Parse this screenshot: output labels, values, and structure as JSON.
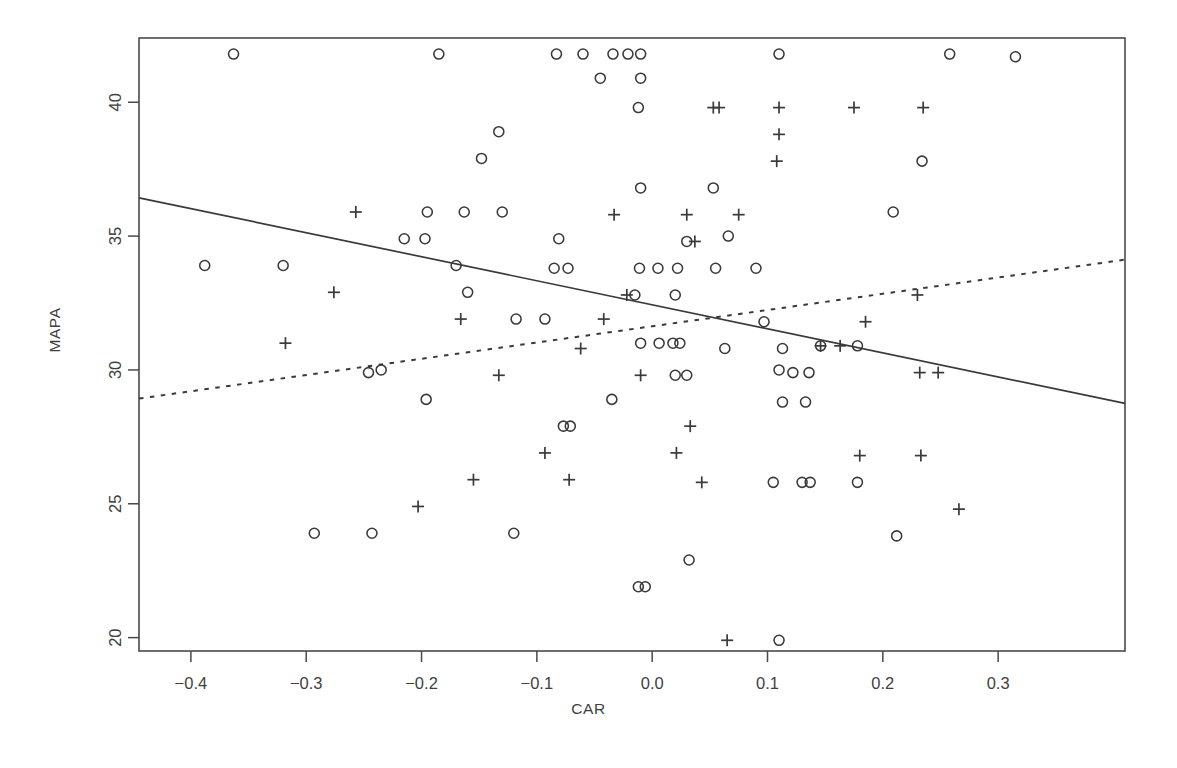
{
  "chart_data": {
    "type": "scatter",
    "title": "",
    "xlabel": "CAR",
    "ylabel": "MAPA",
    "xlim": [
      -0.445,
      0.41
    ],
    "ylim": [
      19.5,
      42.4
    ],
    "xticks": [
      -0.4,
      -0.3,
      -0.2,
      -0.1,
      0.0,
      0.1,
      0.2,
      0.3
    ],
    "xticklabels": [
      "-0.4",
      "-0.3",
      "-0.2",
      "-0.1",
      "0.0",
      "0.1",
      "0.2",
      "0.3"
    ],
    "yticks": [
      20,
      25,
      30,
      35,
      40
    ],
    "yticklabels": [
      "20",
      "25",
      "30",
      "35",
      "40"
    ],
    "grid": false,
    "legend": "none",
    "frame": true,
    "axis_color": "#4a4a4a",
    "marker_color": "#3a3a3a",
    "series": [
      {
        "name": "circle-group",
        "marker": "circle",
        "points": [
          [
            -0.363,
            41.8
          ],
          [
            -0.185,
            41.8
          ],
          [
            -0.083,
            41.8
          ],
          [
            -0.06,
            41.8
          ],
          [
            -0.034,
            41.8
          ],
          [
            -0.021,
            41.8
          ],
          [
            -0.01,
            41.8
          ],
          [
            0.11,
            41.8
          ],
          [
            0.258,
            41.8
          ],
          [
            0.315,
            41.7
          ],
          [
            -0.045,
            40.9
          ],
          [
            -0.01,
            40.9
          ],
          [
            -0.012,
            39.8
          ],
          [
            -0.133,
            38.9
          ],
          [
            -0.148,
            37.9
          ],
          [
            0.234,
            37.8
          ],
          [
            -0.01,
            36.8
          ],
          [
            0.053,
            36.8
          ],
          [
            -0.195,
            35.9
          ],
          [
            -0.163,
            35.9
          ],
          [
            -0.13,
            35.9
          ],
          [
            0.209,
            35.9
          ],
          [
            -0.215,
            34.9
          ],
          [
            -0.197,
            34.9
          ],
          [
            -0.081,
            34.9
          ],
          [
            0.03,
            34.8
          ],
          [
            0.066,
            35.0
          ],
          [
            -0.388,
            33.9
          ],
          [
            -0.32,
            33.9
          ],
          [
            -0.17,
            33.9
          ],
          [
            -0.085,
            33.8
          ],
          [
            -0.073,
            33.8
          ],
          [
            -0.011,
            33.8
          ],
          [
            0.005,
            33.8
          ],
          [
            0.022,
            33.8
          ],
          [
            0.055,
            33.8
          ],
          [
            0.09,
            33.8
          ],
          [
            -0.16,
            32.9
          ],
          [
            -0.015,
            32.8
          ],
          [
            0.02,
            32.8
          ],
          [
            -0.118,
            31.9
          ],
          [
            -0.093,
            31.9
          ],
          [
            -0.01,
            31.0
          ],
          [
            0.006,
            31.0
          ],
          [
            0.018,
            31.0
          ],
          [
            0.024,
            31.0
          ],
          [
            0.063,
            30.8
          ],
          [
            0.097,
            31.8
          ],
          [
            -0.246,
            29.9
          ],
          [
            -0.235,
            30.0
          ],
          [
            0.11,
            30.0
          ],
          [
            0.122,
            29.9
          ],
          [
            0.136,
            29.9
          ],
          [
            0.146,
            30.9
          ],
          [
            0.178,
            30.9
          ],
          [
            0.113,
            30.8
          ],
          [
            0.03,
            29.8
          ],
          [
            0.02,
            29.8
          ],
          [
            -0.196,
            28.9
          ],
          [
            -0.035,
            28.9
          ],
          [
            0.113,
            28.8
          ],
          [
            0.133,
            28.8
          ],
          [
            -0.077,
            27.9
          ],
          [
            -0.071,
            27.9
          ],
          [
            0.13,
            25.8
          ],
          [
            0.137,
            25.8
          ],
          [
            0.105,
            25.8
          ],
          [
            0.178,
            25.8
          ],
          [
            -0.293,
            23.9
          ],
          [
            -0.243,
            23.9
          ],
          [
            -0.12,
            23.9
          ],
          [
            0.212,
            23.8
          ],
          [
            0.032,
            22.9
          ],
          [
            -0.012,
            21.9
          ],
          [
            -0.006,
            21.9
          ],
          [
            0.11,
            19.9
          ]
        ]
      },
      {
        "name": "plus-group",
        "marker": "plus",
        "points": [
          [
            0.053,
            39.8
          ],
          [
            0.058,
            39.8
          ],
          [
            0.11,
            39.8
          ],
          [
            0.175,
            39.8
          ],
          [
            0.235,
            39.8
          ],
          [
            0.11,
            38.8
          ],
          [
            0.108,
            37.8
          ],
          [
            -0.257,
            35.9
          ],
          [
            -0.033,
            35.8
          ],
          [
            0.03,
            35.8
          ],
          [
            0.075,
            35.8
          ],
          [
            0.037,
            34.8
          ],
          [
            -0.276,
            32.9
          ],
          [
            -0.022,
            32.8
          ],
          [
            0.23,
            32.8
          ],
          [
            -0.166,
            31.9
          ],
          [
            -0.042,
            31.9
          ],
          [
            0.185,
            31.8
          ],
          [
            -0.318,
            31.0
          ],
          [
            -0.062,
            30.8
          ],
          [
            0.146,
            30.9
          ],
          [
            0.163,
            30.9
          ],
          [
            -0.133,
            29.8
          ],
          [
            -0.01,
            29.8
          ],
          [
            0.232,
            29.9
          ],
          [
            0.248,
            29.9
          ],
          [
            0.033,
            27.9
          ],
          [
            -0.093,
            26.9
          ],
          [
            0.021,
            26.9
          ],
          [
            0.18,
            26.8
          ],
          [
            0.233,
            26.8
          ],
          [
            -0.155,
            25.9
          ],
          [
            -0.072,
            25.9
          ],
          [
            0.043,
            25.8
          ],
          [
            -0.203,
            24.9
          ],
          [
            0.266,
            24.8
          ],
          [
            0.065,
            19.9
          ]
        ]
      }
    ],
    "lines": [
      {
        "name": "solid-regression-line",
        "style": "solid",
        "x0": -0.445,
        "y0": 36.43,
        "x1": 0.41,
        "y1": 28.75
      },
      {
        "name": "dashed-regression-line",
        "style": "dashed",
        "x0": -0.445,
        "y0": 28.93,
        "x1": 0.41,
        "y1": 34.12
      }
    ]
  }
}
